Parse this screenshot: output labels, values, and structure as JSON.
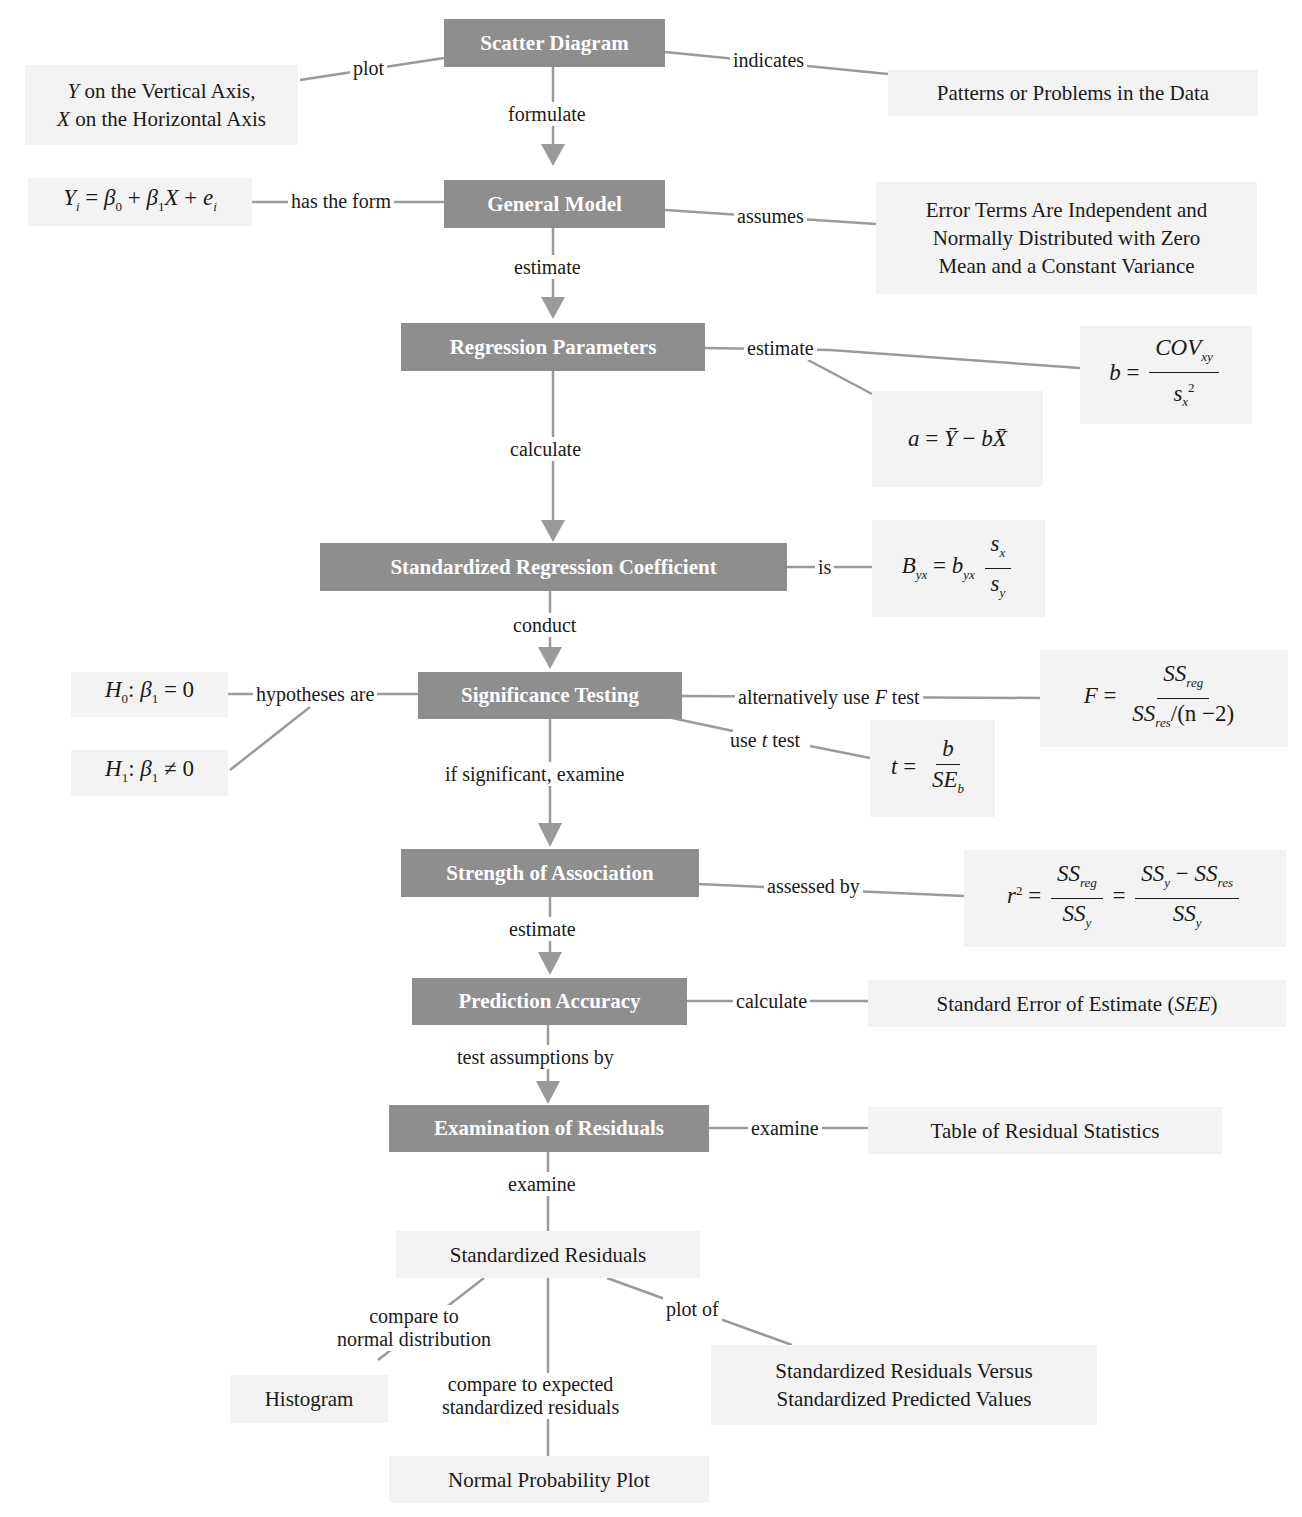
{
  "colors": {
    "concept_fill": "#8e8e8e",
    "concept_text": "#ffffff",
    "detail_fill": "#f3f3f3",
    "connector": "#9a9a9a",
    "text": "#1a1a1a"
  },
  "concepts": {
    "scatter": "Scatter Diagram",
    "general_model": "General Model",
    "regression_parameters": "Regression Parameters",
    "std_coefficient": "Standardized Regression Coefficient",
    "significance": "Significance Testing",
    "strength": "Strength of Association",
    "prediction": "Prediction Accuracy",
    "residuals": "Examination of Residuals"
  },
  "details": {
    "axes_line1_var": "Y",
    "axes_line1_rest": " on the Vertical Axis,",
    "axes_line2_var": "X",
    "axes_line2_rest": " on the Horizontal Axis",
    "patterns": "Patterns or Problems in the Data",
    "model_formula": "Yi = β0 + β1X + ei",
    "assumptions_lines": [
      "Error Terms Are Independent and",
      "Normally Distributed with Zero",
      "Mean and a Constant Variance"
    ],
    "slope_formula": "b = COVxy / sx²",
    "intercept_formula": "a = Ȳ − bX̄",
    "std_coef_formula": "Byx = byx sx / sy",
    "h0": "H0: β1 = 0",
    "h1": "H1: β1 ≠ 0",
    "f_formula": "F = SSreg / (SSres/(n −2))",
    "t_formula": "t = b / SEb",
    "r2_formula": "r² = SSreg/SSy = (SSy − SSres)/SSy",
    "see_text": "Standard Error of Estimate (",
    "see_abbr": "SEE",
    "see_close": ")",
    "residual_table": "Table of Residual Statistics",
    "std_residuals": "Standardized Residuals",
    "histogram": "Histogram",
    "normal_plot": "Normal Probability Plot",
    "versus_lines": [
      "Standardized Residuals Versus",
      "Standardized Predicted Values"
    ]
  },
  "links": {
    "plot": "plot",
    "indicates": "indicates",
    "formulate": "formulate",
    "has_the_form": "has the form",
    "assumes": "assumes",
    "estimate1": "estimate",
    "estimate2": "estimate",
    "calculate1": "calculate",
    "is": "is",
    "conduct": "conduct",
    "hypotheses_are": "hypotheses are",
    "alt_f_pre": "alternatively use ",
    "alt_f_var": "F",
    "alt_f_post": " test",
    "use_t_pre": "use ",
    "use_t_var": "t",
    "use_t_post": " test",
    "if_significant": "if significant, examine",
    "assessed_by": "assessed by",
    "estimate3": "estimate",
    "calculate2": "calculate",
    "test_assumptions": "test assumptions by",
    "examine1": "examine",
    "examine2": "examine",
    "compare_normal_lines": [
      "compare to",
      "normal distribution"
    ],
    "plot_of": "plot of",
    "compare_expected_lines": [
      "compare to expected",
      "standardized residuals"
    ]
  },
  "math": {
    "Y": "Y",
    "i": "i",
    "eq": " = ",
    "beta": "β",
    "zero": "0",
    "one": "1",
    "plus": " + ",
    "X": "X",
    "e": "e",
    "b": "b",
    "a": "a",
    "COV": "COV",
    "xy": "xy",
    "s": "s",
    "x": "x",
    "y": "y",
    "two": "2",
    "Ybar": "Ȳ",
    "Xbar": "X̄",
    "minus": " − ",
    "B": "B",
    "yx": "yx",
    "H": "H",
    "colon": ": ",
    "neq": " ≠ ",
    "zero_val": "0",
    "F": "F",
    "SS": "SS",
    "reg": "reg",
    "res": "res",
    "n_minus_2": "/(n −2)",
    "t": "t",
    "SE": "SE",
    "r": "r"
  }
}
